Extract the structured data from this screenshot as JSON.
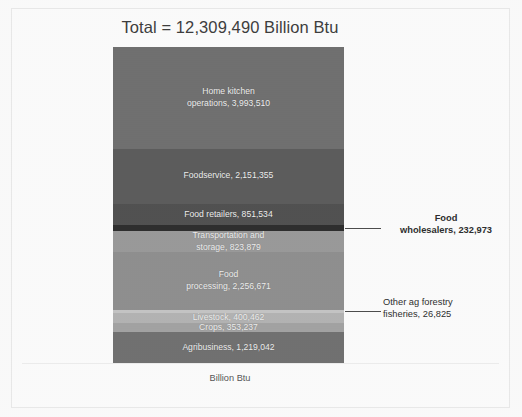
{
  "chart_data": {
    "type": "bar",
    "subtype": "stacked-single-column",
    "title": "Total = 12,309,490 Billion Btu",
    "xlabel": "",
    "ylabel": "",
    "axis_caption": "Billion Btu",
    "units": "Billion Btu",
    "total": 12309490,
    "grid": false,
    "legend": "none",
    "orientation": "vertical",
    "categories": [
      "Home kitchen operations",
      "Foodservice",
      "Food retailers",
      "Food wholesalers",
      "Transportation and storage",
      "Food processing",
      "Other ag forestry fisheries",
      "Livestock",
      "Crops",
      "Agribusiness"
    ],
    "values": [
      3993510,
      2151355,
      851534,
      232973,
      823879,
      2256671,
      26825,
      400462,
      353237,
      1219042
    ],
    "segments": [
      {
        "name": "home-kitchen-operations",
        "label": "Home kitchen\noperations,  3,993,510",
        "value": 3993510,
        "color": "#6f6f6f",
        "label_inside": true,
        "callout": false
      },
      {
        "name": "foodservice",
        "label": "Foodservice,  2,151,355",
        "value": 2151355,
        "color": "#5b5b5b",
        "label_inside": true,
        "callout": false
      },
      {
        "name": "food-retailers",
        "label": "Food retailers,  851,534",
        "value": 851534,
        "color": "#4f4f4f",
        "label_inside": true,
        "callout": false
      },
      {
        "name": "food-wholesalers",
        "label": "",
        "value": 232973,
        "color": "#2b2b2b",
        "label_inside": false,
        "callout": true,
        "callout_text": "Food\nwholesalers,  232,973"
      },
      {
        "name": "transportation-and-storage",
        "label": "Transportation and\nstorage,  823,879",
        "value": 823879,
        "color": "#9a9a9a",
        "label_inside": true,
        "callout": false
      },
      {
        "name": "food-processing",
        "label": "Food\nprocessing,  2,256,671",
        "value": 2256671,
        "color": "#8f8f8f",
        "label_inside": true,
        "callout": false
      },
      {
        "name": "other-ag-forestry-fisheries",
        "label": "",
        "value": 26825,
        "color": "#c6c6c6",
        "label_inside": false,
        "callout": true,
        "callout_text": "Other ag forestry\nfisheries,  26,825"
      },
      {
        "name": "livestock",
        "label": "Livestock,  400,462",
        "value": 400462,
        "color": "#b4b4b4",
        "label_inside": true,
        "callout": false
      },
      {
        "name": "crops",
        "label": "Crops,  353,237",
        "value": 353237,
        "color": "#a3a3a3",
        "label_inside": true,
        "callout": false
      },
      {
        "name": "agribusiness",
        "label": "Agribusiness,  1,219,042",
        "value": 1219042,
        "color": "#707070",
        "label_inside": true,
        "callout": false
      }
    ],
    "callouts": [
      {
        "name": "food-wholesalers",
        "text": "Food\nwholesalers,  232,973",
        "value": 232973
      },
      {
        "name": "other-ag-forestry-fisheries",
        "text": "Other ag forestry\nfisheries,  26,825",
        "value": 26825
      }
    ],
    "colors": {
      "background": "#ffffff",
      "frame_border": "#ececec",
      "title_text": "#3b3b3b",
      "segment_text": "#f2f2f2",
      "callout_text": "#2b2b2b",
      "leader_line": "#4a4a4a",
      "baseline": "#efefef"
    }
  }
}
